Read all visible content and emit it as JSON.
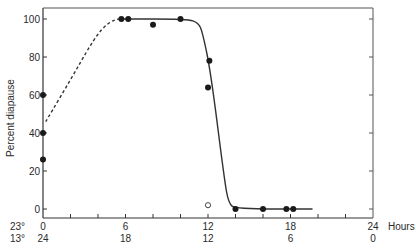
{
  "chart_data": {
    "type": "line",
    "title": "",
    "ylabel": "Percent diapause",
    "xlabel": "Hours",
    "xlim": [
      0,
      24
    ],
    "ylim": [
      0,
      100
    ],
    "grid": false,
    "legend": null,
    "y_ticks": [
      0,
      20,
      40,
      60,
      80,
      100
    ],
    "x_ticks": [
      0,
      2,
      4,
      6,
      8,
      10,
      12,
      14,
      16,
      18,
      20,
      22,
      24
    ],
    "x_tick_labels_top": [
      {
        "x": 0,
        "label": "0"
      },
      {
        "x": 6,
        "label": "6"
      },
      {
        "x": 12,
        "label": "12"
      },
      {
        "x": 18,
        "label": "18"
      },
      {
        "x": 24,
        "label": "24"
      }
    ],
    "x_tick_labels_bottom": [
      {
        "x": 0,
        "label": "24"
      },
      {
        "x": 6,
        "label": "18"
      },
      {
        "x": 12,
        "label": "12"
      },
      {
        "x": 18,
        "label": "6"
      },
      {
        "x": 24,
        "label": "0"
      }
    ],
    "row_labels": {
      "top": "23°",
      "bottom": "13°"
    },
    "x_unit_label": "Hours",
    "series": [
      {
        "name": "observed (filled)",
        "marker": "filled-circle",
        "points": [
          {
            "x": 0,
            "y": 60
          },
          {
            "x": 0,
            "y": 40
          },
          {
            "x": 0,
            "y": 26
          },
          {
            "x": 5.7,
            "y": 100
          },
          {
            "x": 6.2,
            "y": 100
          },
          {
            "x": 8,
            "y": 97
          },
          {
            "x": 10,
            "y": 100
          },
          {
            "x": 12.1,
            "y": 78
          },
          {
            "x": 12,
            "y": 64
          },
          {
            "x": 14,
            "y": 0
          },
          {
            "x": 16,
            "y": 0
          },
          {
            "x": 17.7,
            "y": 0
          },
          {
            "x": 18.2,
            "y": 0
          }
        ]
      },
      {
        "name": "observed (open)",
        "marker": "open-circle",
        "points": [
          {
            "x": 12,
            "y": 2
          }
        ]
      },
      {
        "name": "fitted curve (dashed, extrapolated)",
        "style": "dashed",
        "points": [
          {
            "x": 0.2,
            "y": 46
          },
          {
            "x": 2,
            "y": 68
          },
          {
            "x": 3.5,
            "y": 87
          },
          {
            "x": 4.3,
            "y": 95
          },
          {
            "x": 5,
            "y": 99
          },
          {
            "x": 5.5,
            "y": 100
          }
        ]
      },
      {
        "name": "fitted curve (solid)",
        "style": "solid",
        "points": [
          {
            "x": 5.5,
            "y": 100
          },
          {
            "x": 10.5,
            "y": 100
          },
          {
            "x": 11.3,
            "y": 98
          },
          {
            "x": 11.6,
            "y": 93
          },
          {
            "x": 12.2,
            "y": 72
          },
          {
            "x": 13.2,
            "y": 15
          },
          {
            "x": 13.5,
            "y": 3
          },
          {
            "x": 14,
            "y": 0
          },
          {
            "x": 19.6,
            "y": 0
          }
        ]
      }
    ]
  }
}
